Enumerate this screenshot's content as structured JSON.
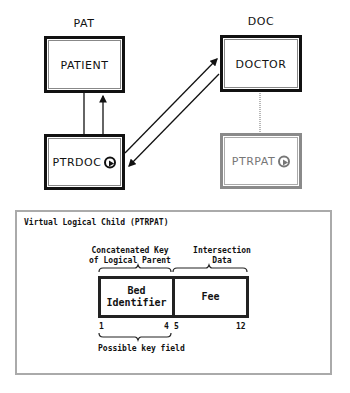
{
  "diagram": {
    "databases": [
      {
        "name": "PAT",
        "segments": [
          {
            "name": "PATIENT",
            "type": "physical-root"
          },
          {
            "name": "PTRDOC",
            "type": "physical-logical-child",
            "has_pointer_icon": true
          }
        ]
      },
      {
        "name": "DOC",
        "segments": [
          {
            "name": "DOCTOR",
            "type": "physical-root"
          },
          {
            "name": "PTRPAT",
            "type": "virtual-logical-child",
            "has_pointer_icon": true
          }
        ]
      }
    ],
    "relationships": [
      {
        "from": "PATIENT",
        "to": "PTRDOC",
        "kind": "physical parent-child (two lines, arrow up)"
      },
      {
        "from": "PTRDOC",
        "to": "DOCTOR",
        "kind": "logical pointer (arrow to DOCTOR)"
      },
      {
        "from": "DOCTOR",
        "to": "PTRDOC",
        "kind": "logical pointer (arrow back)"
      },
      {
        "from": "DOCTOR",
        "to": "PTRPAT",
        "kind": "virtual (dotted)"
      }
    ]
  },
  "panel": {
    "title": "Virtual Logical Child (PTRPAT)",
    "key_label_line1": "Concatenated Key",
    "key_label_line2": "of Logical Parent",
    "data_label_line1": "Intersection",
    "data_label_line2": "Data",
    "fields": [
      {
        "label_line1": "Bed",
        "label_line2": "Identifier",
        "start": "1",
        "end": "4"
      },
      {
        "label_line1": "Fee",
        "label_line2": "",
        "start": "5",
        "end": "12"
      }
    ],
    "footer_label": "Possible key field"
  },
  "colors": {
    "physical_border": "#111111",
    "virtual_border": "#8a8a8a",
    "panel_border": "#aaaaaa"
  }
}
